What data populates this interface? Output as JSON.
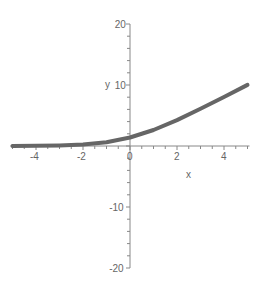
{
  "chart_data": {
    "type": "line",
    "title": "",
    "xlabel": "x",
    "ylabel": "y",
    "xlim": [
      -5,
      5
    ],
    "ylim": [
      -20,
      20
    ],
    "grid": false,
    "legend": null,
    "x_ticks": [
      -4,
      -2,
      0,
      2,
      4
    ],
    "y_ticks": [
      -20,
      -10,
      10,
      20
    ],
    "x_tick_labels": [
      "-4",
      "-2",
      "0",
      "2",
      "4"
    ],
    "y_tick_labels": [
      "-20",
      "-10",
      "10",
      "20"
    ],
    "series": [
      {
        "name": "curve",
        "color": "#666666",
        "x": [
          -5,
          -4,
          -3,
          -2,
          -1,
          0,
          1,
          2,
          3,
          4,
          5
        ],
        "y": [
          0.01,
          0.04,
          0.1,
          0.25,
          0.63,
          1.39,
          2.63,
          4.25,
          6.1,
          8.04,
          10.01
        ]
      }
    ]
  },
  "axes": {
    "x_label": "x",
    "y_label": "y",
    "origin_label": "0"
  },
  "colors": {
    "axis": "#888888",
    "curve": "#666666",
    "text": "#666666"
  }
}
